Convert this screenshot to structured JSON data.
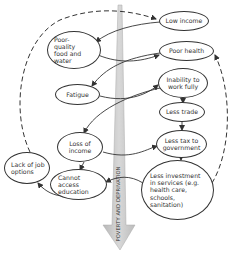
{
  "diagram": {
    "central_arrow": {
      "label": "POVERTY AND DEPRIVATION",
      "color": "#c8c8c8",
      "direction": "down"
    },
    "nodes": [
      {
        "id": "low_income",
        "label": "Low income"
      },
      {
        "id": "poor_food",
        "label": "Poor-quality food and water"
      },
      {
        "id": "poor_health",
        "label": "Poor health"
      },
      {
        "id": "inability_work",
        "label": "Inability to work fully"
      },
      {
        "id": "fatigue",
        "label": "Fatigue"
      },
      {
        "id": "less_trade",
        "label": "Less trade"
      },
      {
        "id": "loss_income",
        "label": "Loss of income"
      },
      {
        "id": "less_tax",
        "label": "Less tax to government"
      },
      {
        "id": "lack_job",
        "label": "Lack of job options"
      },
      {
        "id": "cannot_education",
        "label": "Cannot access education"
      },
      {
        "id": "less_investment",
        "label": "Less investment in services (e.g. health care, schools, sanitation)"
      }
    ],
    "edges": [
      {
        "from": "low_income",
        "to": "poor_food",
        "style": "solid"
      },
      {
        "from": "poor_food",
        "to": "poor_health",
        "style": "solid"
      },
      {
        "from": "poor_health",
        "to": "fatigue",
        "style": "solid"
      },
      {
        "from": "fatigue",
        "to": "inability_work",
        "style": "solid"
      },
      {
        "from": "inability_work",
        "to": "less_trade",
        "style": "solid"
      },
      {
        "from": "inability_work",
        "to": "loss_income",
        "style": "solid"
      },
      {
        "from": "less_trade",
        "to": "less_tax",
        "style": "solid"
      },
      {
        "from": "loss_income",
        "to": "less_tax",
        "style": "solid"
      },
      {
        "from": "loss_income",
        "to": "cannot_education",
        "style": "solid"
      },
      {
        "from": "less_tax",
        "to": "less_investment",
        "style": "solid"
      },
      {
        "from": "less_investment",
        "to": "cannot_education",
        "style": "solid"
      },
      {
        "from": "cannot_education",
        "to": "lack_job",
        "style": "solid"
      },
      {
        "from": "lack_job",
        "to": "low_income",
        "style": "dashed"
      },
      {
        "from": "less_investment",
        "to": "poor_health",
        "style": "dashed"
      }
    ]
  }
}
